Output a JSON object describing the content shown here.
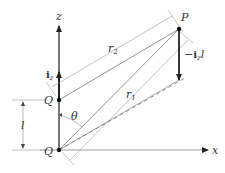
{
  "diagram": {
    "type": "physics-geometry",
    "labels": {
      "z_axis": "z",
      "x_axis": "x",
      "point_p": "P",
      "point_q_upper": "Q",
      "point_q_origin": "Q",
      "unit_vector": "i",
      "unit_vector_sub": "z",
      "neg_moment_prefix": "−",
      "neg_moment_vec": "i",
      "neg_moment_sub": "z",
      "neg_moment_suffix": "l",
      "r1": "r",
      "r1_sub": "1",
      "r2": "r",
      "r2_sub": "2",
      "length": "l",
      "angle": "θ"
    },
    "colors": {
      "line": "#555555",
      "thin_line": "#999999",
      "axis": "#333333",
      "text": "#333333"
    }
  }
}
